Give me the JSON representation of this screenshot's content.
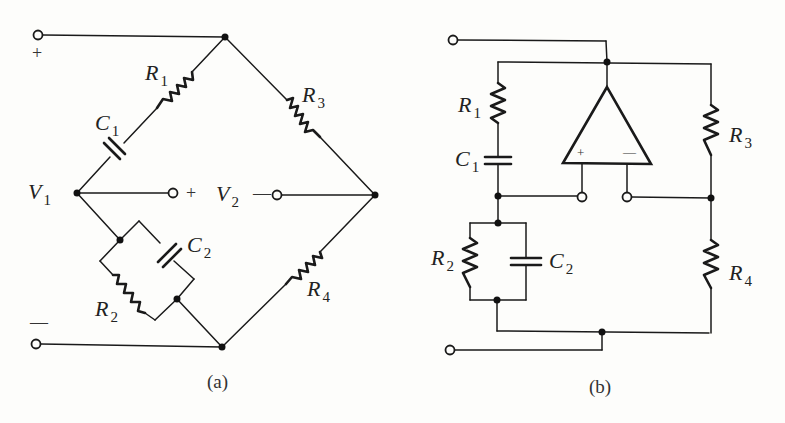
{
  "figure": {
    "panels": [
      {
        "id": "a",
        "caption": "(a)",
        "description": "Bridge network: R1 in series with C1 on upper-left arm, R3 on upper-right arm, R2 parallel C2 on lower-left arm, R4 on lower-right arm",
        "terminals": {
          "top_plus": "+",
          "bottom_minus": "—"
        },
        "components": {
          "R1": {
            "name": "R",
            "sub": "1"
          },
          "C1": {
            "name": "C",
            "sub": "1"
          },
          "R3": {
            "name": "R",
            "sub": "3"
          },
          "R2": {
            "name": "R",
            "sub": "2"
          },
          "C2": {
            "name": "C",
            "sub": "2"
          },
          "R4": {
            "name": "R",
            "sub": "4"
          }
        },
        "nodes": {
          "V1": {
            "name": "V",
            "sub": "1"
          },
          "V2": {
            "name": "V",
            "sub": "2"
          },
          "v2_plus": "+",
          "v2_minus": "—"
        }
      },
      {
        "id": "b",
        "caption": "(b)",
        "description": "Same bridge redrawn with op-amp across the bridge's middle nodes; left arm R1 + C1 over R2 || C2, right arm R3 over R4",
        "components": {
          "R1": {
            "name": "R",
            "sub": "1"
          },
          "C1": {
            "name": "C",
            "sub": "1"
          },
          "R3": {
            "name": "R",
            "sub": "3"
          },
          "R2": {
            "name": "R",
            "sub": "2"
          },
          "C2": {
            "name": "C",
            "sub": "2"
          },
          "R4": {
            "name": "R",
            "sub": "4"
          }
        },
        "opamp": {
          "plus": "+",
          "minus": "—"
        }
      }
    ]
  }
}
